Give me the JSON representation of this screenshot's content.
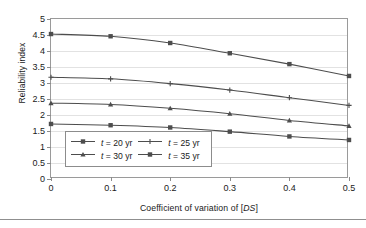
{
  "chart_data": {
    "type": "line",
    "title": "",
    "xlabel": "Coefficient of variation of [DS]",
    "ylabel": "Reliability index",
    "xlim": [
      0,
      0.5
    ],
    "ylim": [
      0,
      5
    ],
    "xticks": [
      "0",
      "0.1",
      "0.2",
      "0.3",
      "0.4",
      "0.5"
    ],
    "yticks": [
      "0",
      "0.5",
      "1",
      "1.5",
      "2",
      "2.5",
      "3",
      "3.5",
      "4",
      "4.5",
      "5"
    ],
    "grid": "horizontal",
    "legend_position": "inside lower-left",
    "x": [
      0,
      0.1,
      0.2,
      0.3,
      0.4,
      0.5
    ],
    "series": [
      {
        "name": "t = 20 yr",
        "marker": "square",
        "color": "#4d4d4d",
        "values": [
          4.53,
          4.46,
          4.25,
          3.93,
          3.59,
          3.22
        ]
      },
      {
        "name": "t = 25 yr",
        "marker": "cross",
        "color": "#4d4d4d",
        "values": [
          3.18,
          3.13,
          2.98,
          2.78,
          2.54,
          2.3
        ]
      },
      {
        "name": "t = 30 yr",
        "marker": "triangle",
        "color": "#4d4d4d",
        "values": [
          2.37,
          2.33,
          2.21,
          2.04,
          1.83,
          1.66
        ]
      },
      {
        "name": "t = 35 yr",
        "marker": "square",
        "color": "#4d4d4d",
        "values": [
          1.72,
          1.68,
          1.61,
          1.48,
          1.33,
          1.22
        ]
      }
    ]
  },
  "axes": {
    "x_title_pre": "Coefficient of variation of [",
    "x_title_italic": "DS",
    "x_title_post": "]",
    "y_title": "Reliability index"
  },
  "legend": {
    "entries": [
      {
        "pre": "",
        "italic": "t",
        "post": " = 20 yr"
      },
      {
        "pre": "",
        "italic": "t",
        "post": " = 25 yr"
      },
      {
        "pre": "",
        "italic": "t",
        "post": " = 30 yr"
      },
      {
        "pre": "",
        "italic": "t",
        "post": " = 35 yr"
      }
    ]
  },
  "style": {
    "line_color": "#4d4d4d",
    "frame_color": "#9a9a9a",
    "grid_color": "#e2e2e2",
    "text_color": "#1a1a1a"
  }
}
